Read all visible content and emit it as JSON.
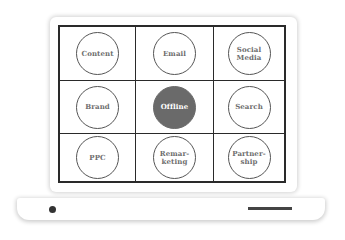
{
  "diagram": {
    "type": "laptop-grid",
    "colors": {
      "grid_line": "#2a2a2a",
      "circle_stroke": "#555555",
      "label_text": "#6e6e6e",
      "highlight_fill": "#6a6a6a",
      "highlight_text": "#ffffff"
    },
    "cells": [
      {
        "label": "Content",
        "highlighted": false
      },
      {
        "label": "Email",
        "highlighted": false
      },
      {
        "label": "Social\nMedia",
        "highlighted": false
      },
      {
        "label": "Brand",
        "highlighted": false
      },
      {
        "label": "Offline",
        "highlighted": true
      },
      {
        "label": "Search",
        "highlighted": false
      },
      {
        "label": "PPC",
        "highlighted": false
      },
      {
        "label": "Remar-\nketing",
        "highlighted": false
      },
      {
        "label": "Partner-\nship",
        "highlighted": false
      }
    ]
  }
}
